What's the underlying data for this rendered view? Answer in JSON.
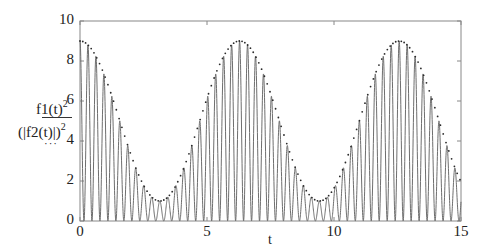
{
  "chart_data": {
    "type": "line",
    "title": "",
    "xlabel": "t",
    "ylabel": [
      "f1(t)^2",
      "(|f2(t)|)^2"
    ],
    "xlim": [
      0,
      15
    ],
    "ylim": [
      0,
      10
    ],
    "x_ticks": [
      0,
      5,
      10,
      15
    ],
    "y_ticks": [
      0,
      2,
      4,
      6,
      8,
      10
    ],
    "grid": false,
    "legend": "none (trace styles shown under y-axis labels)",
    "series": [
      {
        "name": "f1(t)^2",
        "style": "solid gray line",
        "description": "fast oscillation, ~ (5 + 4cos t) * cos^2(10 t), period ~0.314",
        "peak_values_sampled": {
          "t": [
            0,
            1.57,
            3.14,
            4.71,
            6.28,
            7.85,
            9.42,
            11.0,
            12.57,
            14.14,
            15.0
          ],
          "y": [
            9,
            5,
            1,
            5,
            9,
            5,
            1,
            5,
            9,
            5,
            1.3
          ]
        },
        "min": 0
      },
      {
        "name": "(|f2(t)|)^2",
        "style": "dotted dark line (envelope)",
        "description": "envelope ~ 5 + 4cos(t)",
        "x": [
          0,
          1,
          2,
          3,
          3.14,
          4,
          5,
          6,
          6.28,
          7,
          8,
          9,
          9.42,
          10,
          11,
          12,
          12.57,
          13,
          14,
          15
        ],
        "values": [
          9.0,
          7.16,
          3.34,
          1.04,
          1.0,
          2.39,
          6.13,
          8.84,
          9.0,
          8.02,
          4.42,
          1.36,
          1.0,
          1.64,
          5.0,
          8.38,
          9.0,
          8.63,
          5.55,
          1.96
        ]
      }
    ]
  },
  "axis": {
    "x_tick_labels": [
      "0",
      "5",
      "10",
      "15"
    ],
    "y_tick_labels": [
      "0",
      "2",
      "4",
      "6",
      "8",
      "10"
    ],
    "x_title": "t",
    "y_label_1": "f1(t)",
    "y_label_2": "(|f2(t)|)",
    "y_label_sup": "2",
    "y_label_1_style": "—",
    "y_label_2_style": "···"
  },
  "colors": {
    "trace1": "#6e6e6e",
    "trace2": "#2a2a2a",
    "axes": "#777777"
  }
}
